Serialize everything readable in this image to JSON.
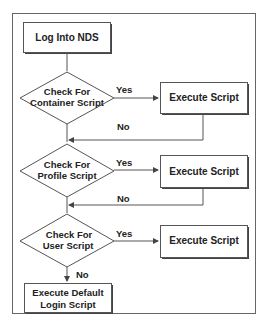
{
  "diagram": {
    "type": "flowchart",
    "nodes": {
      "start": {
        "label": "Log Into NDS",
        "shape": "rectangle"
      },
      "check_container": {
        "line1": "Check For",
        "line2": "Container Script",
        "shape": "diamond"
      },
      "exec_container": {
        "label": "Execute Script",
        "shape": "rectangle"
      },
      "check_profile": {
        "line1": "Check For",
        "line2": "Profile Script",
        "shape": "diamond"
      },
      "exec_profile": {
        "label": "Execute Script",
        "shape": "rectangle"
      },
      "check_user": {
        "line1": "Check For",
        "line2": "User Script",
        "shape": "diamond"
      },
      "exec_user": {
        "label": "Execute Script",
        "shape": "rectangle"
      },
      "default": {
        "line1": "Execute Default",
        "line2": "Login Script",
        "shape": "rectangle"
      }
    },
    "edges": {
      "yes_label": "Yes",
      "no_label": "No"
    },
    "colors": {
      "stroke": "#555555",
      "shadow": "#333333",
      "text": "#222222",
      "background": "#ffffff"
    }
  }
}
